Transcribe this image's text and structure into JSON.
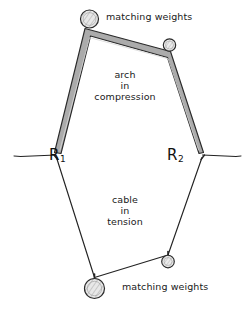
{
  "diagram": {
    "background_color": "#ffffff",
    "ink_color": "#1a1a1a",
    "arch_fill_color": "#a9a9a9",
    "labels": {
      "weights_top": "matching weights",
      "weights_bottom": "matching weights",
      "arch_line1": "arch",
      "arch_line2": "in",
      "arch_line3": "compression",
      "cable_line1": "cable",
      "cable_line2": "in",
      "cable_line3": "tension",
      "reaction_left": "R",
      "reaction_left_sub": "1",
      "reaction_right": "R",
      "reaction_right_sub": "2"
    },
    "elements": {
      "arch_member": "thick-shaded-arch-member",
      "cable_member": "thin-line-cable-member",
      "weight_top_left": "large-hatched-circle-weight",
      "weight_top_right": "small-hatched-circle-weight",
      "weight_bottom_left": "large-hatched-circle-weight",
      "weight_bottom_right": "small-hatched-circle-weight",
      "support_left": "horizontal-support-line",
      "support_right": "horizontal-support-line"
    }
  }
}
